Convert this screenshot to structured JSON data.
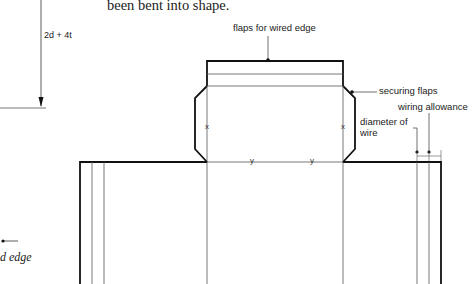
{
  "text": {
    "body_fragment": "been bent into shape.",
    "left_edge_fragment": "d edge"
  },
  "dimension": {
    "height_label": "2d + 4t"
  },
  "callouts": {
    "flaps_wired_edge": "flaps for wired edge",
    "securing_flaps": "securing flaps",
    "wiring_allowance": "wiring allowance",
    "diameter_of_wire_line1": "diameter of",
    "diameter_of_wire_line2": "wire"
  },
  "marks": {
    "x_left": "x",
    "x_right": "x",
    "y_left": "y",
    "y_right": "y"
  },
  "colors": {
    "line": "#111111",
    "thin_line": "#555555",
    "background": "#ffffff"
  }
}
